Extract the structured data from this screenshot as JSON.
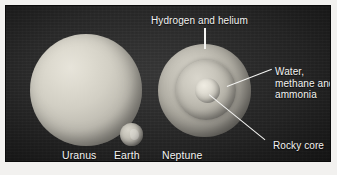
{
  "figure": {
    "background_color": "#242424",
    "page_color": "#f2f1ef",
    "text_color": "#f3f3f1"
  },
  "callouts": {
    "hydrogen": "Hydrogen and helium",
    "water": "Water, methane and ammonia",
    "core": "Rocky core"
  },
  "planets": {
    "uranus": {
      "name": "Uranus"
    },
    "earth": {
      "name": "Earth"
    },
    "neptune": {
      "name": "Neptune"
    }
  },
  "icons": {
    "uranus_sphere": "planet-sphere-icon",
    "earth_sphere": "planet-sphere-icon",
    "neptune_sphere": "planet-cutaway-icon",
    "neptune_mantle": "mantle-shell-icon",
    "neptune_core": "rocky-core-icon"
  }
}
